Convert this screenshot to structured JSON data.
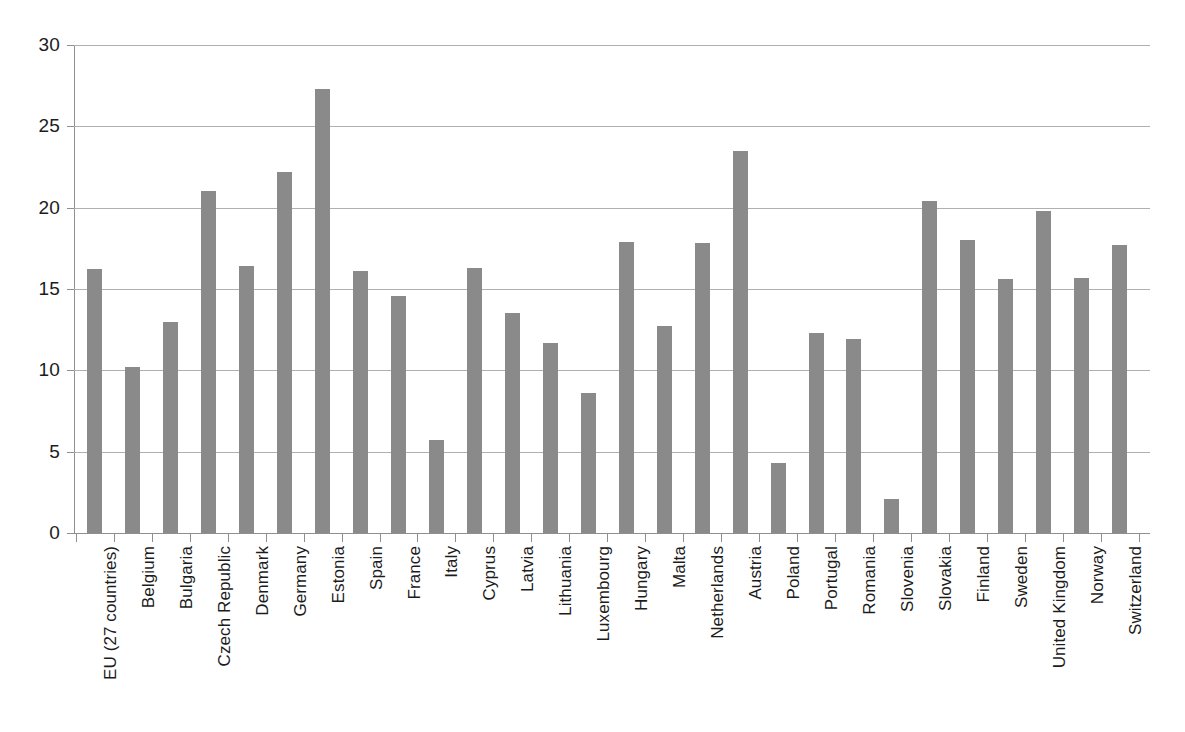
{
  "chart_data": {
    "type": "bar",
    "title": "",
    "subtitle": "",
    "xlabel": "",
    "ylabel": "",
    "ylim": [
      0,
      30
    ],
    "yticks": [
      0,
      5,
      10,
      15,
      20,
      25,
      30
    ],
    "ytick_labels": [
      "0",
      "5",
      "10",
      "15",
      "20",
      "25",
      "30"
    ],
    "grid": true,
    "legend": "none",
    "bar_color": "#8a8a8a",
    "gridline_color": "#b0b0b0",
    "axis_color": "#8f8f8f",
    "categories": [
      "EU (27 countries)",
      "Belgium",
      "Bulgaria",
      "Czech Republic",
      "Denmark",
      "Germany",
      "Estonia",
      "Spain",
      "France",
      "Italy",
      "Cyprus",
      "Latvia",
      "Lithuania",
      "Luxembourg",
      "Hungary",
      "Malta",
      "Netherlands",
      "Austria",
      "Poland",
      "Portugal",
      "Romania",
      "Slovenia",
      "Slovakia",
      "Finland",
      "Sweden",
      "United Kingdom",
      "Norway",
      "Switzerland"
    ],
    "values": [
      16.2,
      10.2,
      13.0,
      21.0,
      16.4,
      22.2,
      27.3,
      16.1,
      14.6,
      5.7,
      16.3,
      13.5,
      11.7,
      8.6,
      17.9,
      12.7,
      17.8,
      23.5,
      4.3,
      12.3,
      11.9,
      2.1,
      20.4,
      18.0,
      15.6,
      19.8,
      15.7,
      17.7
    ]
  }
}
